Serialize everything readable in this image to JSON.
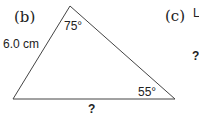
{
  "figure": {
    "part_b": {
      "label": "(b)",
      "side_label": "6.0 cm",
      "top_angle": "75°",
      "right_angle": "55°",
      "base_label": "?"
    },
    "part_c": {
      "label": "(c)",
      "partial_text": "L",
      "question_mark": "?"
    }
  }
}
